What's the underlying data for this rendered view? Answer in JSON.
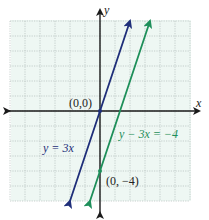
{
  "chart_data": {
    "type": "line",
    "title": "",
    "xlabel": "x",
    "ylabel": "y",
    "xlim": [
      -6,
      6
    ],
    "ylim": [
      -6,
      6
    ],
    "grid": true,
    "grid_step": 1,
    "legend": "none",
    "series": [
      {
        "name": "y = 3x",
        "equation": "y = 3x",
        "color": "#1f2f7a",
        "x": [
          -2,
          0,
          2
        ],
        "y": [
          -6,
          0,
          6
        ],
        "arrows": "both"
      },
      {
        "name": "y - 3x = -4",
        "equation": "y − 3x = −4",
        "color": "#1e8f5a",
        "x": [
          -0.667,
          0,
          3.333
        ],
        "y": [
          -6,
          -4,
          6
        ],
        "arrows": "both"
      }
    ],
    "points": [
      {
        "x": 0,
        "y": 0,
        "label": "(0,0)",
        "color": "#1f2f7a"
      },
      {
        "x": 0,
        "y": -4,
        "label": "(0, −4)",
        "color": "#1e8f5a"
      }
    ],
    "annotations": [
      {
        "text": "y = 3x",
        "color": "#1f2f7a"
      },
      {
        "text": "y − 3x = −4",
        "color": "#1e8f5a"
      }
    ]
  },
  "labels": {
    "x_axis": "x",
    "y_axis": "y",
    "origin_point": "(0,0)",
    "intercept_point": "(0, −4)",
    "line1": "y = 3x",
    "line2": "y − 3x = −4"
  },
  "colors": {
    "grid_bg": "#eef7f3",
    "grid_line": "#b9c4c0",
    "axis": "#1a1a1a",
    "line1": "#1f2f7a",
    "line2": "#1e8f5a",
    "text": "#222222"
  }
}
